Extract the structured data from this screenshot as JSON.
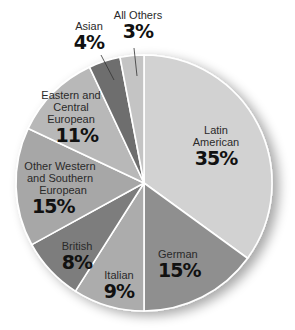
{
  "chart_data": {
    "type": "pie",
    "title": "",
    "categories": [
      "Latin American",
      "German",
      "Italian",
      "British",
      "Other Western and Southern European",
      "Eastern and Central European",
      "Asian",
      "All Others"
    ],
    "values": [
      35,
      15,
      9,
      8,
      15,
      11,
      4,
      3
    ],
    "unit": "%",
    "start_angle_deg": 0,
    "direction": "clockwise",
    "colors": [
      "#d2d2d2",
      "#8f8f8f",
      "#acacac",
      "#7d7d7d",
      "#a7a7a7",
      "#b8b8b8",
      "#6e6e6e",
      "#c4c4c4"
    ],
    "legend": "none (labels inside slices)"
  },
  "labels": {
    "latin": {
      "name_1": "Latin",
      "name_2": "American",
      "pct": "35%"
    },
    "german": {
      "name": "German",
      "pct": "15%"
    },
    "italian": {
      "name": "Italian",
      "pct": "9%"
    },
    "british": {
      "name": "British",
      "pct": "8%"
    },
    "other_western": {
      "name_1": "Other Western",
      "name_2": "and Southern",
      "name_3": "European",
      "pct": "15%"
    },
    "eastern": {
      "name_1": "Eastern and",
      "name_2": "Central",
      "name_3": "European",
      "pct": "11%"
    },
    "asian": {
      "name": "Asian",
      "pct": "4%"
    },
    "all_others": {
      "name": "All Others",
      "pct": "3%"
    }
  }
}
